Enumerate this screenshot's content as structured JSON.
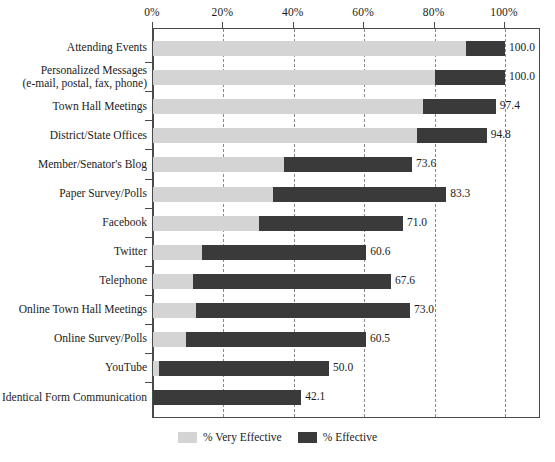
{
  "chart_data": {
    "type": "bar",
    "orientation": "horizontal",
    "stacked": true,
    "title": "",
    "subtitle": "",
    "xlabel": "",
    "ylabel": "",
    "xlim": [
      0,
      100
    ],
    "xticks": [
      0,
      20,
      40,
      60,
      80,
      100
    ],
    "xticklabels": [
      "0%",
      "20%",
      "40%",
      "60%",
      "80%",
      "100%"
    ],
    "grid": "vertical-dashed",
    "legend_position": "bottom-center",
    "categories": [
      "Attending Events",
      "Personalized Messages (e-mail, postal, fax, phone)",
      "Town Hall Meetings",
      "District/State Offices",
      "Member/Senator's Blog",
      "Paper Survey/Polls",
      "Facebook",
      "Twitter",
      "Telephone",
      "Online Town Hall Meetings",
      "Online Survey/Polls",
      "YouTube",
      "Identical Form Communication"
    ],
    "series": [
      {
        "name": "% Very Effective",
        "color": "#d4d4d4",
        "values": [
          88.9,
          80.0,
          76.8,
          74.9,
          37.3,
          34.1,
          30.1,
          14.0,
          11.4,
          12.3,
          9.4,
          1.8,
          0.0
        ]
      },
      {
        "name": "% Effective",
        "color": "#3a3a3a",
        "values": [
          11.1,
          20.0,
          20.6,
          19.9,
          36.3,
          49.2,
          40.9,
          46.6,
          56.2,
          60.7,
          51.1,
          48.2,
          42.1
        ]
      }
    ],
    "totals": [
      100.0,
      100.0,
      97.4,
      94.8,
      73.6,
      83.3,
      71.0,
      60.6,
      67.6,
      73.0,
      60.5,
      50.0,
      42.1
    ],
    "data_labels": [
      "100.0",
      "100.0",
      "97.4",
      "94.8",
      "73.6",
      "83.3",
      "71.0",
      "60.6",
      "67.6",
      "73.0",
      "60.5",
      "50.0",
      "42.1"
    ]
  },
  "category_labels": [
    {
      "line1": "Attending Events",
      "line2": ""
    },
    {
      "line1": "Personalized Messages",
      "line2": "(e-mail, postal, fax, phone)"
    },
    {
      "line1": "Town Hall Meetings",
      "line2": ""
    },
    {
      "line1": "District/State Offices",
      "line2": ""
    },
    {
      "line1": "Member/Senator's Blog",
      "line2": ""
    },
    {
      "line1": "Paper Survey/Polls",
      "line2": ""
    },
    {
      "line1": "Facebook",
      "line2": ""
    },
    {
      "line1": "Twitter",
      "line2": ""
    },
    {
      "line1": "Telephone",
      "line2": ""
    },
    {
      "line1": "Online Town Hall Meetings",
      "line2": ""
    },
    {
      "line1": "Online Survey/Polls",
      "line2": ""
    },
    {
      "line1": "YouTube",
      "line2": ""
    },
    {
      "line1": "Identical Form Communication",
      "line2": ""
    }
  ],
  "legend": {
    "items": [
      {
        "label": "% Very Effective",
        "color": "#d4d4d4"
      },
      {
        "label": "% Effective",
        "color": "#3a3a3a"
      }
    ]
  },
  "colors": {
    "very_effective": "#d4d4d4",
    "effective": "#3a3a3a",
    "axis": "#4a4a4a",
    "gridline": "#8a8a8a",
    "text": "#1b1b1b",
    "background": "#ffffff"
  }
}
